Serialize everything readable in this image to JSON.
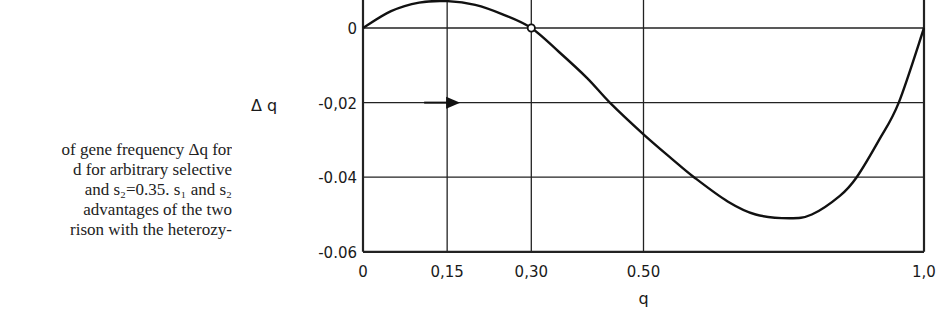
{
  "caption": {
    "lines": [
      "of gene frequency Δq for",
      "d for arbitrary selective",
      " and s₂=0.35. s₁ and s₂",
      "advantages of the two",
      "rison with the heterozy-"
    ]
  },
  "chart_data": {
    "type": "line",
    "title": "",
    "xlabel": "q",
    "ylabel": "Δ q",
    "xlim": [
      0,
      1.0
    ],
    "ylim": [
      -0.06,
      0.01
    ],
    "grid": true,
    "x_ticks": [
      0,
      0.15,
      0.3,
      0.5,
      1.0
    ],
    "x_tick_labels": [
      "0",
      "0,15",
      "0,30",
      "0.50",
      "1,0"
    ],
    "y_ticks": [
      0,
      -0.02,
      -0.04,
      -0.06
    ],
    "y_tick_labels": [
      "0",
      "-0,02",
      "-0.04",
      "-0.06"
    ],
    "series": [
      {
        "name": "Δq",
        "x": [
          0,
          0.05,
          0.1,
          0.15,
          0.2,
          0.25,
          0.3,
          0.35,
          0.4,
          0.44,
          0.5,
          0.55,
          0.59,
          0.65,
          0.7,
          0.76,
          0.8,
          0.85,
          0.88,
          0.92,
          0.955,
          1.0
        ],
        "values": [
          0,
          0.0045,
          0.0068,
          0.0072,
          0.0062,
          0.0036,
          0,
          -0.0065,
          -0.0135,
          -0.02,
          -0.0285,
          -0.035,
          -0.04,
          -0.0465,
          -0.05,
          -0.051,
          -0.05,
          -0.045,
          -0.04,
          -0.03,
          -0.02,
          0
        ]
      }
    ],
    "annotations": [
      {
        "type": "open-circle",
        "x": 0.3,
        "y": 0,
        "meaning": "unstable equilibrium"
      },
      {
        "type": "arrow",
        "direction": "right",
        "x": 0.15,
        "y": -0.0125
      }
    ]
  }
}
